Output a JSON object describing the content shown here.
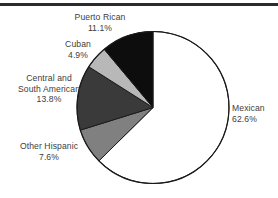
{
  "chart_data": {
    "type": "pie",
    "title": "",
    "subtitle": "",
    "xlabel": "",
    "ylabel": "",
    "legend_position": "none",
    "grid": false,
    "units": "percent",
    "start_angle_deg": 0,
    "direction": "clockwise",
    "categories": [
      "Mexican",
      "Other Hispanic",
      "Central and South American",
      "Cuban",
      "Puerto Rican"
    ],
    "values": [
      62.6,
      7.6,
      13.8,
      4.9,
      11.1
    ],
    "slices": [
      {
        "id": "mexican",
        "name": "Mexican",
        "name_line1": "Mexican",
        "value": 62.6,
        "percent_label": "62.6%",
        "color": "#ffffff",
        "stroke": "#1a1a1a"
      },
      {
        "id": "other-hispanic",
        "name": "Other Hispanic",
        "name_line1": "Other Hispanic",
        "value": 7.6,
        "percent_label": "7.6%",
        "color": "#808080",
        "stroke": "#1a1a1a"
      },
      {
        "id": "central-and-south-american",
        "name": "Central and South American",
        "name_line1": "Central and",
        "name_line2": "South American",
        "value": 13.8,
        "percent_label": "13.8%",
        "color": "#3a3a3a",
        "stroke": "#1a1a1a"
      },
      {
        "id": "cuban",
        "name": "Cuban",
        "name_line1": "Cuban",
        "value": 4.9,
        "percent_label": "4.9%",
        "color": "#b8b8b8",
        "stroke": "#1a1a1a"
      },
      {
        "id": "puerto-rican",
        "name": "Puerto Rican",
        "name_line1": "Puerto Rican",
        "value": 11.1,
        "percent_label": "11.1%",
        "color": "#0d0d0d",
        "stroke": "#1a1a1a"
      }
    ],
    "geometry": {
      "cx": 153,
      "cy": 107.5,
      "r": 76
    },
    "colors": {
      "background": "#ffffff",
      "outline": "#1a1a1a",
      "text": "#3d3d3d",
      "rule": "#2b2b2b"
    }
  }
}
